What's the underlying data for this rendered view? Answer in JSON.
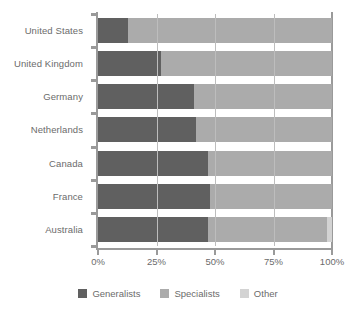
{
  "chart_data": {
    "type": "bar",
    "orientation": "horizontal",
    "stacked": true,
    "stack_total": 100,
    "title": "",
    "subtitle": "",
    "xlabel": "",
    "ylabel": "",
    "xlim": [
      0,
      100
    ],
    "xticks": [
      0,
      25,
      50,
      75,
      100
    ],
    "xticklabels": [
      "0%",
      "25%",
      "50%",
      "75%",
      "100%"
    ],
    "grid": "vertical",
    "legend_position": "bottom-center",
    "categories": [
      "United States",
      "United Kingdom",
      "Germany",
      "Netherlands",
      "Canada",
      "France",
      "Australia"
    ],
    "series": [
      {
        "name": "Generalists",
        "color": "#606060",
        "values": [
          13,
          27,
          41,
          42,
          47,
          48,
          47
        ]
      },
      {
        "name": "Specialists",
        "color": "#ababab",
        "values": [
          87,
          73,
          59,
          58,
          53,
          52,
          51
        ]
      },
      {
        "name": "Other",
        "color": "#d3d3d3",
        "values": [
          0,
          0,
          0,
          0,
          0,
          0,
          2
        ]
      }
    ]
  },
  "legend": {
    "items": [
      {
        "label": "Generalists",
        "color": "#606060"
      },
      {
        "label": "Specialists",
        "color": "#ababab"
      },
      {
        "label": "Other",
        "color": "#d3d3d3"
      }
    ]
  },
  "colors": {
    "generalists": "#606060",
    "specialists": "#ababab",
    "other": "#d3d3d3",
    "axis": "#9a9a9a",
    "gridline": "#bdbdbd",
    "text": "#6b6b6b",
    "background": "#ffffff"
  }
}
